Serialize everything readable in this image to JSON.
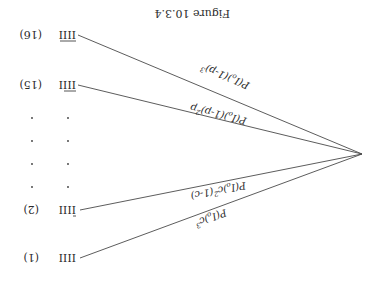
{
  "figure": {
    "caption": "Figure 10.3.4",
    "orientation": "rotated 180 degrees",
    "root": {
      "label": ""
    },
    "branches": [
      {
        "index": "(1)",
        "pattern": "IIII",
        "overbars": [
          false,
          false,
          false,
          false
        ],
        "edge_label_main": "P(I",
        "edge_label_sub": "o",
        "edge_label_rest": ")c",
        "edge_label_exp": "3",
        "edge_label_tail": ""
      },
      {
        "index": "(2)",
        "pattern": "IIII",
        "overbars": [
          false,
          false,
          false,
          true
        ],
        "edge_label_main": "P(I",
        "edge_label_sub": "o",
        "edge_label_rest": ")c",
        "edge_label_exp": "2",
        "edge_label_tail": "(1-c)"
      },
      {
        "index": "(15)",
        "pattern": "IIII",
        "overbars": [
          false,
          true,
          true,
          true
        ],
        "edge_label_main": "P(I",
        "edge_label_sub": "o",
        "edge_label_rest": ")(1-p)",
        "edge_label_exp": "2",
        "edge_label_tail": "p"
      },
      {
        "index": "(16)",
        "pattern": "IIII",
        "overbars": [
          true,
          true,
          true,
          true
        ],
        "edge_label_main": "P(I",
        "edge_label_sub": "o",
        "edge_label_rest": ")(1-p)",
        "edge_label_exp": "3",
        "edge_label_tail": ""
      }
    ],
    "ellipsis": "·"
  }
}
